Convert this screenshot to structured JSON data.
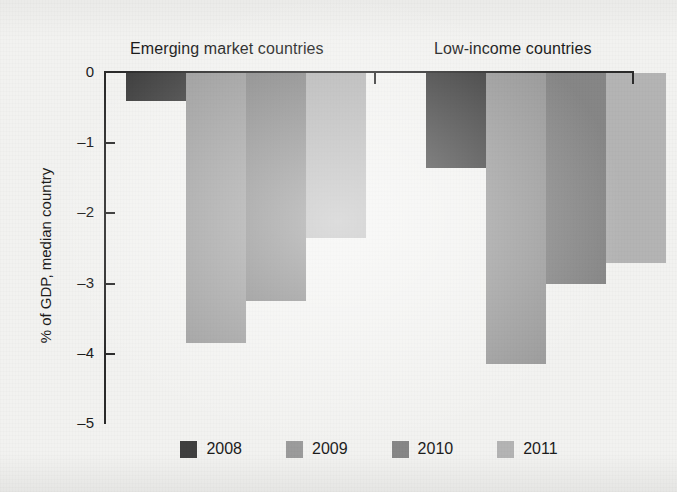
{
  "chart_data": {
    "type": "bar",
    "title": "",
    "xlabel": "",
    "ylabel": "% of GDP, median country",
    "ylim": [
      -5,
      0
    ],
    "yticks": [
      0,
      -1,
      -2,
      -3,
      -4,
      -5
    ],
    "ytick_labels": [
      "0",
      "–1",
      "–2",
      "–3",
      "–4",
      "–5"
    ],
    "grid": false,
    "legend_position": "bottom",
    "categories": [
      "Emerging market countries",
      "Low-income countries"
    ],
    "series": [
      {
        "name": "2008",
        "color": "#3f3f3f",
        "values": [
          -0.4,
          -1.35
        ]
      },
      {
        "name": "2009",
        "color": "#9b9b9b",
        "values": [
          -3.85,
          -4.15
        ]
      },
      {
        "name": "2010",
        "color": "#868686",
        "values": [
          -3.25,
          -3.0
        ]
      },
      {
        "name": "2011",
        "color": "#b4b4b4",
        "values": [
          -2.35,
          -2.7
        ]
      }
    ]
  },
  "axis": {
    "y_title": "% of GDP, median country",
    "ticks": [
      {
        "label": "0",
        "value": 0
      },
      {
        "label": "–1",
        "value": -1
      },
      {
        "label": "–2",
        "value": -2
      },
      {
        "label": "–3",
        "value": -3
      },
      {
        "label": "–4",
        "value": -4
      },
      {
        "label": "–5",
        "value": -5
      }
    ]
  },
  "groups": [
    {
      "label": "Emerging market countries"
    },
    {
      "label": "Low-income countries"
    }
  ],
  "legend": {
    "items": [
      {
        "label": "2008",
        "color": "#3f3f3f"
      },
      {
        "label": "2009",
        "color": "#9b9b9b"
      },
      {
        "label": "2010",
        "color": "#868686"
      },
      {
        "label": "2011",
        "color": "#b4b4b4"
      }
    ]
  },
  "colors": {
    "background": "#f2f2f0",
    "axis": "#2b2b2b",
    "text": "#1c1c1c"
  }
}
